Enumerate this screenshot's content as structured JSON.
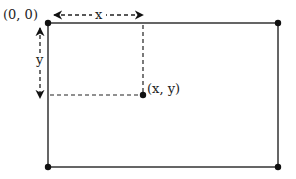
{
  "diagram": {
    "labels": {
      "origin": "(0, 0)",
      "x_axis": "x",
      "y_axis": "y",
      "point": "(x, y)"
    },
    "colors": {
      "line": "#333333",
      "dot": "#111111",
      "dashed": "#222222"
    }
  }
}
